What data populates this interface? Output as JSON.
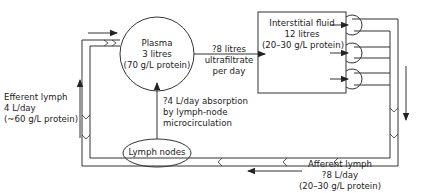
{
  "diagram": {
    "stroke_color": "#333333",
    "background": "#ffffff",
    "nodes": {
      "plasma": {
        "lines": [
          "Plasma",
          "3 litres",
          "(70 g/L protein)"
        ]
      },
      "interstitial": {
        "lines": [
          "Interstitial fluid",
          "12 litres",
          "(20–30 g/L protein)"
        ]
      },
      "lymph_nodes": {
        "lines": [
          "Lymph nodes"
        ]
      }
    },
    "edges": {
      "ultrafiltrate": {
        "lines": [
          "?8 litres",
          "ultrafiltrate",
          "per day"
        ]
      },
      "absorption": {
        "lines": [
          "?4 L/day absorption",
          "by lymph-node",
          "microcirculation"
        ]
      },
      "efferent": {
        "lines": [
          "Efferent lymph",
          "4 L/day",
          "(~60 g/L protein)"
        ]
      },
      "afferent": {
        "lines": [
          "Afferent lymph",
          "?8 L/day",
          "(20–30 g/L protein)"
        ]
      }
    }
  }
}
